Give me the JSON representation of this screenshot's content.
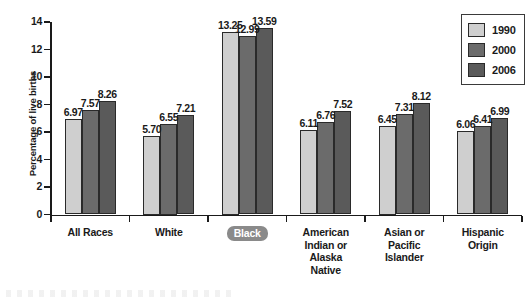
{
  "chart_data": {
    "type": "bar",
    "title": "",
    "xlabel": "",
    "ylabel": "Percentage of live births",
    "ylim": [
      0,
      14
    ],
    "yticks": [
      0,
      2,
      4,
      6,
      8,
      10,
      12,
      14
    ],
    "grid": false,
    "legend_position": "top-right",
    "categories": [
      "All Races",
      "White",
      "Black",
      "American Indian or Alaska Native",
      "Asian or Pacific Islander",
      "Hispanic Origin"
    ],
    "category_lines": [
      [
        "All Races"
      ],
      [
        "White"
      ],
      [
        "Black"
      ],
      [
        "American",
        "Indian or",
        "Alaska",
        "Native"
      ],
      [
        "Asian or",
        "Pacific",
        "Islander"
      ],
      [
        "Hispanic",
        "Origin"
      ]
    ],
    "highlighted_category": "Black",
    "series": [
      {
        "name": "1990",
        "color": "#cfcfcf",
        "values": [
          6.97,
          5.7,
          13.25,
          6.11,
          6.45,
          6.06
        ]
      },
      {
        "name": "2000",
        "color": "#6b6b6b",
        "values": [
          7.57,
          6.55,
          12.99,
          6.76,
          7.31,
          6.41
        ]
      },
      {
        "name": "2006",
        "color": "#5a5a5a",
        "values": [
          8.26,
          7.21,
          13.59,
          7.52,
          8.12,
          6.99
        ]
      }
    ],
    "value_labels": [
      [
        "6.97",
        "7.57",
        "8.26"
      ],
      [
        "5.70",
        "6.55",
        "7.21"
      ],
      [
        "13.25",
        "12.99",
        "13.59"
      ],
      [
        "6.11",
        "6.76",
        "7.52"
      ],
      [
        "6.45",
        "7.31",
        "8.12"
      ],
      [
        "6.06",
        "6.41",
        "6.99"
      ]
    ],
    "ytick_labels": [
      "0",
      "2",
      "4",
      "6",
      "8",
      "10",
      "12",
      "14"
    ]
  },
  "legend": {
    "entries": [
      {
        "label": "1990"
      },
      {
        "label": "2000"
      },
      {
        "label": "2006"
      }
    ]
  }
}
